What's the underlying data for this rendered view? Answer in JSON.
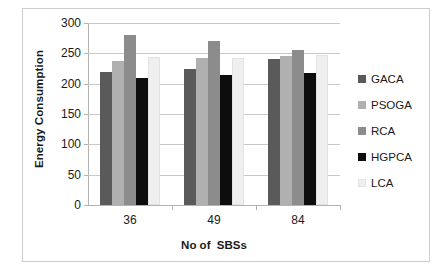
{
  "chart_data": {
    "type": "bar",
    "title": "",
    "xlabel": "No of  SBSs",
    "ylabel": "Energy Consumption",
    "categories": [
      "36",
      "49",
      "84"
    ],
    "ylim": [
      0,
      300
    ],
    "yticks": [
      0,
      50,
      100,
      150,
      200,
      250,
      300
    ],
    "ytick_labels": [
      "0",
      "50",
      "100",
      "150",
      "200",
      "250",
      "300"
    ],
    "grid": true,
    "legend_position": "right",
    "series": [
      {
        "name": "GACA",
        "color": "#5a5a5a",
        "values": [
          220,
          225,
          240
        ]
      },
      {
        "name": "PSOGA",
        "color": "#b0b0b0",
        "values": [
          238,
          243,
          245
        ]
      },
      {
        "name": "RCA",
        "color": "#8c8c8c",
        "values": [
          280,
          270,
          255
        ]
      },
      {
        "name": "HGPCA",
        "color": "#0d0d0d",
        "values": [
          210,
          215,
          218
        ]
      },
      {
        "name": "LCA",
        "color": "#efefef",
        "values": [
          244,
          243,
          247
        ]
      }
    ]
  },
  "legend": {
    "items": [
      {
        "label": "GACA"
      },
      {
        "label": "PSOGA"
      },
      {
        "label": "RCA"
      },
      {
        "label": "HGPCA"
      },
      {
        "label": "LCA"
      }
    ]
  },
  "axes": {
    "y_title": "Energy Consumption",
    "x_title": "No of  SBSs"
  }
}
